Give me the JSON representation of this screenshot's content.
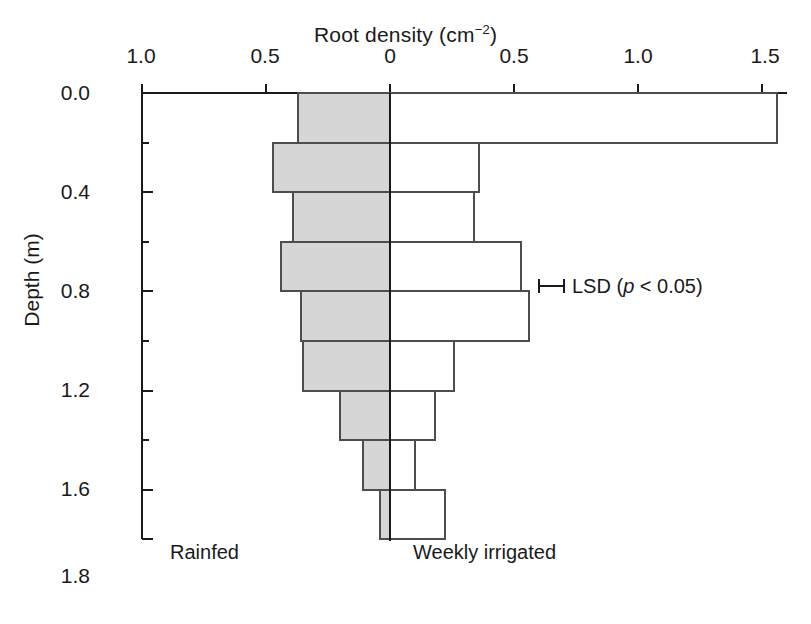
{
  "figure": {
    "top_axis_title": "Root density (cm",
    "top_axis_title_sup": "−2",
    "top_axis_title_close": ")",
    "y_axis_title": "Depth (m)",
    "left_group_label": "Rainfed",
    "right_group_label": "Weekly irrigated",
    "lsd_label_pre": "LSD (",
    "lsd_label_italic": "p",
    "lsd_label_post": " < 0.05)",
    "colors": {
      "axis": "#1a1a1a",
      "left_bar_fill": "#d6d6d6",
      "left_bar_stroke": "#4d4d4d",
      "right_bar_fill": "#ffffff",
      "right_bar_stroke": "#4d4d4d",
      "text": "#1a1a1a"
    }
  },
  "chart_data": {
    "type": "bar",
    "orientation": "horizontal-bidirectional",
    "xlabel": "Root density (cm-2)",
    "ylabel": "Depth (m)",
    "xlim": [
      -1.0,
      1.6
    ],
    "ylim": [
      0.0,
      1.8
    ],
    "y_inverted": true,
    "grid": false,
    "legend": "in-plot text labels",
    "x_tick_labels": [
      "1.0",
      "0.5",
      "0",
      "0.5",
      "1.0",
      "1.5"
    ],
    "x_tick_values": [
      -1.0,
      -0.5,
      0.0,
      0.5,
      1.0,
      1.5
    ],
    "y_tick_labels": [
      "0.0",
      "0.4",
      "0.8",
      "1.2",
      "1.6",
      "1.8"
    ],
    "y_tick_values": [
      0.0,
      0.4,
      0.8,
      1.2,
      1.6,
      1.8
    ],
    "y_minor_tick_values": [
      0.2,
      0.6,
      1.0,
      1.4
    ],
    "depth_bins": [
      [
        0.0,
        0.2
      ],
      [
        0.2,
        0.4
      ],
      [
        0.4,
        0.6
      ],
      [
        0.6,
        0.8
      ],
      [
        0.8,
        1.0
      ],
      [
        1.0,
        1.2
      ],
      [
        1.2,
        1.4
      ],
      [
        1.4,
        1.6
      ],
      [
        1.6,
        1.8
      ]
    ],
    "bin_labels": [
      "0.0-0.2",
      "0.2-0.4",
      "0.4-0.6",
      "0.6-0.8",
      "0.8-1.0",
      "1.0-1.2",
      "1.2-1.4",
      "1.4-1.6",
      "1.6-1.8"
    ],
    "series": [
      {
        "name": "Rainfed",
        "side": "left",
        "fill": "#d6d6d6",
        "values": [
          0.37,
          0.47,
          0.39,
          0.44,
          0.36,
          0.35,
          0.2,
          0.11,
          0.04
        ]
      },
      {
        "name": "Weekly irrigated",
        "side": "right",
        "fill": "#ffffff",
        "values": [
          1.56,
          0.36,
          0.34,
          0.53,
          0.56,
          0.26,
          0.18,
          0.1,
          0.22
        ]
      }
    ],
    "annotations": [
      {
        "name": "LSD",
        "text": "LSD (p < 0.05)",
        "bar_length": 0.1,
        "at_depth": 0.78,
        "at_density": 0.6
      }
    ]
  }
}
